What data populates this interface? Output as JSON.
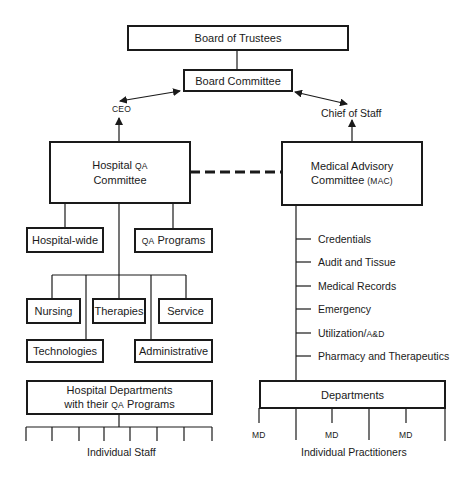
{
  "governance": {
    "board_of_trustees": "Board of Trustees",
    "board_committee": "Board Committee",
    "ceo": "CEO",
    "chief_of_staff": "Chief of Staff"
  },
  "hospital_side": {
    "committee": {
      "line1_a": "Hospital ",
      "line1_b": "QA",
      "line2": "Committee"
    },
    "groups": [
      {
        "label": "Hospital-wide"
      },
      {
        "label_b": "QA",
        "label_a": " Programs"
      }
    ],
    "services": [
      {
        "label": "Nursing"
      },
      {
        "label": "Therapies"
      },
      {
        "label": "Service"
      },
      {
        "label": "Technologies"
      },
      {
        "label": "Administrative"
      }
    ],
    "departments": {
      "line1": "Hospital Departments",
      "line2_a": "with their ",
      "line2_b": "QA",
      "line2_c": " Programs"
    },
    "staff_label": "Individual Staff"
  },
  "medical_side": {
    "committee": {
      "line1": "Medical Advisory",
      "line2_a": "Committee ",
      "line2_b": "(MAC)"
    },
    "subcommittees": [
      {
        "label": "Credentials"
      },
      {
        "label": "Audit and Tissue"
      },
      {
        "label": "Medical Records"
      },
      {
        "label": "Emergency"
      },
      {
        "label_a": "Utilization/",
        "label_b": "A&D"
      },
      {
        "label": "Pharmacy and Therapeutics"
      }
    ],
    "departments": "Departments",
    "md_labels": [
      "MD",
      "MD",
      "MD"
    ],
    "practitioners_label": "Individual Practitioners"
  }
}
